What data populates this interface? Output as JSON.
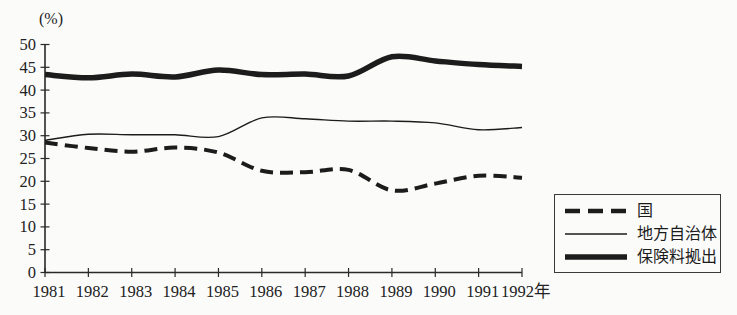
{
  "chart_data": {
    "type": "line",
    "title": "",
    "ylabel": "(%)",
    "xlabel": "",
    "x_axis_unit_suffix": "年",
    "categories": [
      "1981",
      "1982",
      "1983",
      "1984",
      "1985",
      "1986",
      "1987",
      "1988",
      "1989",
      "1990",
      "1991",
      "1992"
    ],
    "x_labels": [
      "1981",
      "1982",
      "1983",
      "1984",
      "1985",
      "1986",
      "1987",
      "1988",
      "1989",
      "1990",
      "1991",
      "1992年"
    ],
    "ylim": [
      0,
      50
    ],
    "yticks": [
      0,
      5,
      10,
      15,
      20,
      25,
      30,
      35,
      40,
      45,
      50
    ],
    "grid": false,
    "legend_position": "outside-bottom-right",
    "line_color": "#1c1c1c",
    "series": [
      {
        "name": "国",
        "line_style": "bold-dashed",
        "values": [
          28.5,
          27.3,
          26.5,
          27.4,
          26.3,
          22.3,
          22.0,
          22.5,
          18.0,
          19.5,
          21.2,
          20.8
        ]
      },
      {
        "name": "地方自治体",
        "line_style": "thin-solid",
        "values": [
          29.0,
          30.3,
          30.2,
          30.2,
          29.8,
          33.9,
          33.7,
          33.2,
          33.2,
          32.8,
          31.3,
          31.8
        ]
      },
      {
        "name": "保険料拠出",
        "line_style": "bold-solid",
        "values": [
          43.4,
          42.7,
          43.5,
          42.9,
          44.4,
          43.4,
          43.5,
          43.1,
          47.3,
          46.4,
          45.6,
          45.2
        ]
      }
    ]
  }
}
